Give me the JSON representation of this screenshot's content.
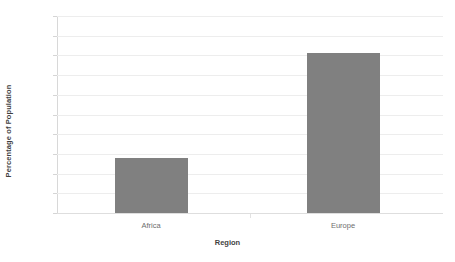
{
  "chart_data": {
    "type": "bar",
    "title": "",
    "xlabel": "Region",
    "ylabel": "Percentage of Population",
    "categories": [
      "Africa",
      "Europe"
    ],
    "values": [
      28,
      81
    ],
    "series": [
      {
        "name": "Percentage of Population",
        "values": [
          28,
          81
        ]
      }
    ],
    "ylim": [
      0,
      100
    ],
    "ytick_labels": [
      "100%",
      "90%",
      "80%",
      "70%",
      "60%",
      "50%",
      "40%",
      "30%",
      "20%",
      "10%",
      "0%"
    ],
    "ytick_values": [
      100,
      90,
      80,
      70,
      60,
      50,
      40,
      30,
      20,
      10,
      0
    ],
    "value_format": "percent",
    "grid": true,
    "legend": false,
    "legend_position": "none",
    "colors": {
      "bar": "#808080",
      "gridline": "#ededed",
      "axis": "#d8d8d8",
      "tick_text": "#7a7a7a",
      "title_text": "#3f3f3f",
      "background": "#ffffff"
    }
  }
}
